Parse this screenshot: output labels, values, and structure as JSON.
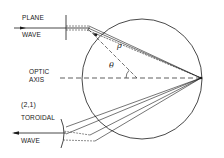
{
  "diagram": {
    "type": "optics-schematic",
    "labels": {
      "plane_wave_line1": "PLANE",
      "plane_wave_line2": "WAVE",
      "optic_axis_line1": "OPTIC",
      "optic_axis_line2": "AXIS",
      "toroidal_mode": "(2,1)",
      "toroidal_wave_line1": "TOROIDAL",
      "toroidal_wave_line2": "WAVE",
      "rho_symbol": "ρ",
      "theta_symbol": "θ"
    },
    "colors": {
      "line": "#1a1a1a",
      "background": "#ffffff"
    }
  }
}
